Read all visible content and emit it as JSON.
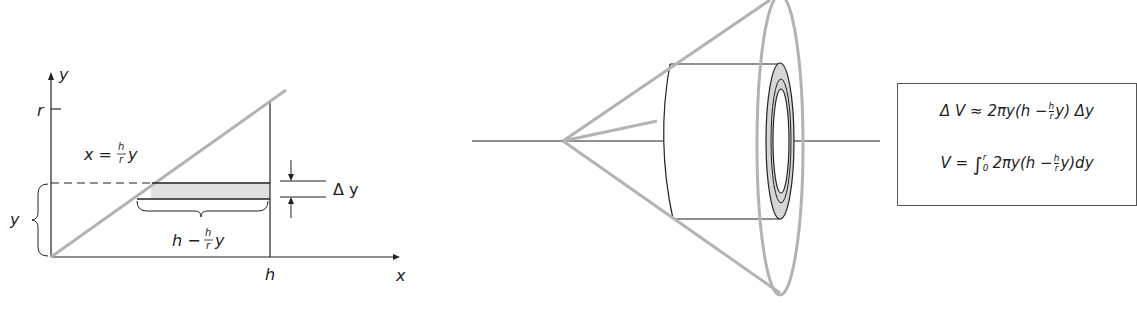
{
  "left_diagram": {
    "axis_x_label": "x",
    "axis_y_label": "y",
    "tick_r_label": "r",
    "tick_h_label": "h",
    "line_equation": {
      "lhs": "x =",
      "frac_num": "h",
      "frac_den": "r",
      "rhs": "y"
    },
    "brace_y_label": "y",
    "strip_length_label": {
      "lhs": "h −",
      "frac_num": "h",
      "frac_den": "r",
      "rhs": "y"
    },
    "delta_y_label": "Δ y"
  },
  "right_formula_box": {
    "line1": {
      "lhs": "Δ V ≈ 2πy(h −",
      "frac_num": "h",
      "frac_den": "r",
      "rhs": "y) Δy"
    },
    "line2": {
      "lhs": "V =",
      "integral": "∫",
      "upper": "r",
      "lower": "0",
      "body": "2πy(h −",
      "frac_num": "h",
      "frac_den": "r",
      "rhs": "y)dy"
    }
  },
  "colors": {
    "gray_stroke": "#b3b3b3",
    "black_stroke": "#222222",
    "shell_fill": "#d6d6d6",
    "strip_fill": "#e0e0e0"
  }
}
